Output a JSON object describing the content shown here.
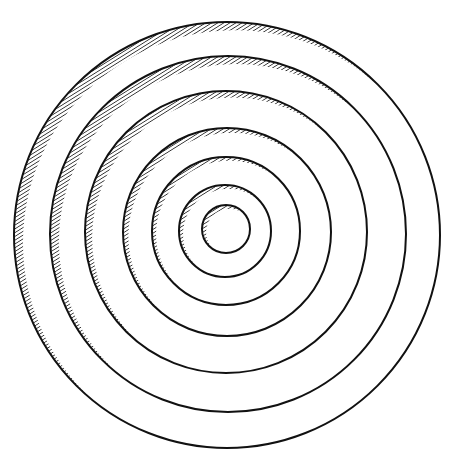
{
  "figure": {
    "width": 454,
    "height": 472,
    "background": "#ffffff",
    "ink": "#111111",
    "stroke_width": 2,
    "hatch": {
      "spacing": 3.2,
      "stroke_width": 1.4,
      "angle_deg": 58,
      "shadow_offset_ratio": 0.055,
      "max_band": 12
    },
    "circles": [
      {
        "cx": 227,
        "cy": 235,
        "r": 213
      },
      {
        "cx": 228,
        "cy": 234,
        "r": 178
      },
      {
        "cx": 226,
        "cy": 232,
        "r": 141
      },
      {
        "cx": 227,
        "cy": 232,
        "r": 104
      },
      {
        "cx": 226,
        "cy": 231,
        "r": 74
      },
      {
        "cx": 225,
        "cy": 231,
        "r": 46
      },
      {
        "cx": 226,
        "cy": 229,
        "r": 24
      }
    ]
  }
}
